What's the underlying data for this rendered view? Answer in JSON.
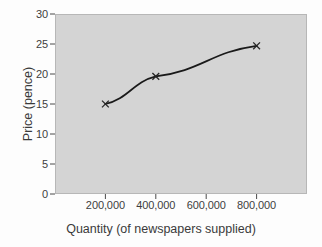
{
  "chart_data": {
    "type": "line",
    "title": "",
    "xlabel": "Quantity (of newspapers supplied)",
    "ylabel": "Price (pence)",
    "xlim": [
      0,
      1000000
    ],
    "ylim": [
      0,
      30
    ],
    "grid": false,
    "legend": null,
    "marker": "x",
    "line_color": "#1a1a1a",
    "plot_bg_color": "#d4d4d4",
    "x": [
      200000,
      400000,
      800000
    ],
    "y": [
      15.0,
      19.6,
      24.7
    ],
    "series": [
      {
        "name": "Supply curve",
        "points": [
          {
            "x": 200000,
            "y": 15.0
          },
          {
            "x": 400000,
            "y": 19.6
          },
          {
            "x": 800000,
            "y": 24.7
          }
        ]
      }
    ],
    "yticks": [
      0,
      5,
      10,
      15,
      20,
      25,
      30
    ],
    "ytick_labels": [
      "0",
      "5",
      "10",
      "15",
      "20",
      "25",
      "30"
    ],
    "xticks": [
      200000,
      400000,
      600000,
      800000
    ],
    "xtick_labels": [
      "200,000",
      "400,000",
      "600,000",
      "800,000"
    ]
  }
}
